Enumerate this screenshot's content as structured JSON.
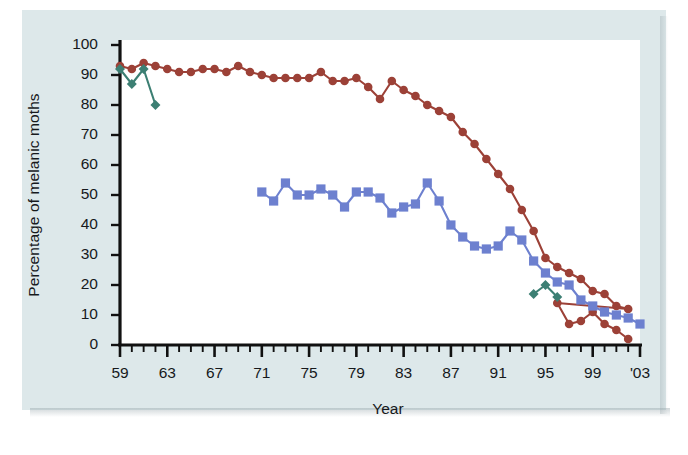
{
  "figure": {
    "background_color": "#dde8ea",
    "plot_background_color": "#ffffff"
  },
  "chart_data": {
    "type": "line",
    "title": "",
    "xlabel": "Year",
    "ylabel": "Percentage of melanic moths",
    "xlim": [
      1959,
      2003
    ],
    "ylim": [
      0,
      100
    ],
    "grid": false,
    "legend": "none",
    "x_tick_labels": [
      "59",
      "63",
      "67",
      "71",
      "75",
      "79",
      "83",
      "87",
      "91",
      "95",
      "99",
      "'03"
    ],
    "x_tick_values": [
      1959,
      1963,
      1967,
      1971,
      1975,
      1979,
      1983,
      1987,
      1991,
      1995,
      1999,
      2003
    ],
    "x_minor_tick_step": 1,
    "y_tick_labels": [
      "0",
      "10",
      "20",
      "30",
      "40",
      "50",
      "60",
      "70",
      "80",
      "90",
      "100"
    ],
    "y_tick_values": [
      0,
      10,
      20,
      30,
      40,
      50,
      60,
      70,
      80,
      90,
      100
    ],
    "series": [
      {
        "name": "red-series",
        "color": "#9c4137",
        "marker": "circle",
        "x": [
          1959,
          1960,
          1961,
          1962,
          1963,
          1964,
          1965,
          1966,
          1967,
          1968,
          1969,
          1970,
          1971,
          1972,
          1973,
          1974,
          1975,
          1976,
          1977,
          1978,
          1979,
          1980,
          1981,
          1982,
          1983,
          1984,
          1985,
          1986,
          1987,
          1988,
          1989,
          1990,
          1991,
          1992,
          1993,
          1994,
          1995,
          1996,
          1997,
          1998,
          1999,
          2000,
          2001,
          2002
        ],
        "values": [
          93,
          92,
          94,
          93,
          92,
          91,
          91,
          92,
          92,
          91,
          93,
          91,
          90,
          89,
          89,
          89,
          89,
          91,
          88,
          88,
          89,
          86,
          82,
          88,
          85,
          83,
          80,
          78,
          76,
          71,
          67,
          62,
          57,
          52,
          45,
          38,
          29,
          26,
          24,
          22,
          18,
          17,
          13,
          12
        ]
      },
      {
        "name": "blue-series",
        "color": "#6d80cf",
        "marker": "square",
        "x": [
          1971,
          1972,
          1973,
          1974,
          1975,
          1976,
          1977,
          1978,
          1979,
          1980,
          1981,
          1982,
          1983,
          1984,
          1985,
          1986,
          1987,
          1988,
          1989,
          1990,
          1991,
          1992,
          1993,
          1994,
          1995,
          1996,
          1997,
          1998,
          1999,
          2000,
          2001,
          2002,
          2003
        ],
        "values": [
          51,
          48,
          54,
          50,
          50,
          52,
          50,
          46,
          51,
          51,
          49,
          44,
          46,
          47,
          54,
          48,
          40,
          36,
          33,
          32,
          33,
          38,
          35,
          28,
          24,
          21,
          20,
          15,
          13,
          11,
          10,
          9,
          7
        ]
      },
      {
        "name": "green-series-early",
        "color": "#3c7f73",
        "marker": "diamond",
        "x": [
          1959,
          1960,
          1961,
          1962
        ],
        "values": [
          92,
          87,
          92,
          80
        ]
      },
      {
        "name": "green-series-late",
        "color": "#3c7f73",
        "marker": "diamond",
        "x": [
          1994,
          1995,
          1996
        ],
        "values": [
          17,
          20,
          16
        ]
      }
    ]
  },
  "red_tail": {
    "x": [
      1996,
      1997,
      1998,
      1999,
      2000,
      2001,
      2002
    ],
    "values": [
      14,
      7,
      8,
      11,
      7,
      5,
      2
    ]
  }
}
